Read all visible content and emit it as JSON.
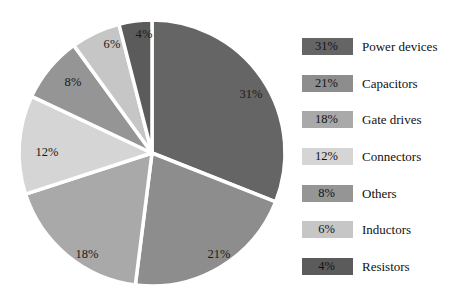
{
  "chart_data": {
    "type": "pie",
    "title": "",
    "subtitle": "",
    "xlabel": "",
    "ylabel": "",
    "legend_position": "right",
    "grid": false,
    "start_angle_deg": 0,
    "direction": "clockwise",
    "categories": [
      "Power devices",
      "Capacitors",
      "Gate drives",
      "Connectors",
      "Others",
      "Inductors",
      "Resistors"
    ],
    "values": [
      31,
      21,
      18,
      12,
      8,
      6,
      4
    ],
    "value_suffix": "%",
    "slices": [
      {
        "label": "Power devices",
        "value": 31,
        "display": "31%",
        "color": "#656565",
        "label_x": 251,
        "label_y": 94
      },
      {
        "label": "Capacitors",
        "value": 21,
        "display": "21%",
        "color": "#8d8d8d",
        "label_x": 219,
        "label_y": 254
      },
      {
        "label": "Gate drives",
        "value": 18,
        "display": "18%",
        "color": "#a9a9a9",
        "label_x": 87,
        "label_y": 254
      },
      {
        "label": "Connectors",
        "value": 12,
        "display": "12%",
        "color": "#d5d5d5",
        "label_x": 47,
        "label_y": 152
      },
      {
        "label": "Others",
        "value": 8,
        "display": "8%",
        "color": "#959595",
        "label_x": 73,
        "label_y": 82
      },
      {
        "label": "Inductors",
        "value": 6,
        "display": "6%",
        "color": "#c6c6c6",
        "label_x": 112,
        "label_y": 44
      },
      {
        "label": "Resistors",
        "value": 4,
        "display": "4%",
        "color": "#5b5b5b",
        "label_x": 144,
        "label_y": 34
      }
    ],
    "geometry": {
      "center_x": 152,
      "center_y": 153,
      "radius": 133,
      "gap_color": "#ffffff",
      "gap_width": 3.5
    }
  },
  "legend": {
    "rows": [
      {
        "percent": "31%",
        "label": "Power devices",
        "color": "#656565",
        "top": 8
      },
      {
        "percent": "21%",
        "label": "Capacitors",
        "color": "#8d8d8d",
        "top": 45
      },
      {
        "percent": "18%",
        "label": "Gate drives",
        "color": "#a9a9a9",
        "top": 81
      },
      {
        "percent": "12%",
        "label": "Connectors",
        "color": "#d5d5d5",
        "top": 118
      },
      {
        "percent": "8%",
        "label": "Others",
        "color": "#959595",
        "top": 155
      },
      {
        "percent": "6%",
        "label": "Inductors",
        "color": "#c6c6c6",
        "top": 191
      },
      {
        "percent": "4%",
        "label": "Resistors",
        "color": "#5b5b5b",
        "top": 228
      }
    ]
  }
}
